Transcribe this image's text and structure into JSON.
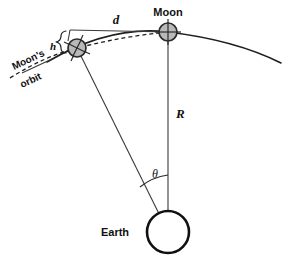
{
  "figure": {
    "labels": {
      "moon": "Moon",
      "earth": "Earth",
      "orbit_line1": "Moon's",
      "orbit_line2": "orbit",
      "distance_d": "d",
      "height_h": "h",
      "radius_R": "R",
      "angle_theta": "θ"
    },
    "colors": {
      "background": "#ffffff",
      "line": "#1f1f1f",
      "moon_fill": "#b9b9b9",
      "moon_stroke": "#2a2a2a",
      "earth_stroke": "#111111",
      "earth_fill": "#ffffff",
      "text": "#111111"
    },
    "geometry": {
      "earth_center": [
        168,
        232
      ],
      "earth_radius": 21,
      "moon_right_center": [
        168,
        32
      ],
      "moon_left_center": [
        77,
        48
      ],
      "moon_radius": 9,
      "orbit_radius": 200,
      "theta_arc_radius": 57
    }
  }
}
